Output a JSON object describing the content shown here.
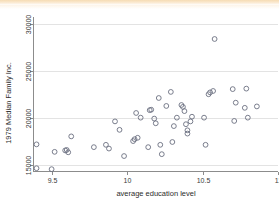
{
  "chart_data": {
    "type": "scatter",
    "title": "",
    "xlabel": "average education level",
    "ylabel": "1979 Median Family Inc.",
    "xlim": [
      9.38,
      11.0
    ],
    "ylim": [
      14300,
      30800
    ],
    "xticks": [
      9.5,
      10,
      10.5,
      11
    ],
    "xticklabels": [
      "9.5",
      "10",
      "10.5",
      "11"
    ],
    "yticks": [
      15000,
      20000,
      25000,
      30000
    ],
    "yticklabels": [
      "15000",
      "20000",
      "25000",
      "30000"
    ],
    "grid": "horizontal",
    "legend": "none",
    "marker": "open-circle",
    "marker_color": "#6b6f80",
    "background_color": "#ffffff",
    "points": [
      {
        "x": 9.4,
        "y": 17200
      },
      {
        "x": 9.4,
        "y": 14650
      },
      {
        "x": 9.5,
        "y": 14550
      },
      {
        "x": 9.52,
        "y": 16400
      },
      {
        "x": 9.59,
        "y": 16550
      },
      {
        "x": 9.6,
        "y": 16600
      },
      {
        "x": 9.61,
        "y": 16350
      },
      {
        "x": 9.63,
        "y": 18050
      },
      {
        "x": 9.78,
        "y": 16900
      },
      {
        "x": 9.86,
        "y": 17150
      },
      {
        "x": 9.88,
        "y": 16750
      },
      {
        "x": 9.92,
        "y": 19650
      },
      {
        "x": 9.95,
        "y": 18750
      },
      {
        "x": 9.98,
        "y": 15950
      },
      {
        "x": 10.04,
        "y": 17550
      },
      {
        "x": 10.05,
        "y": 17750
      },
      {
        "x": 10.06,
        "y": 20550
      },
      {
        "x": 10.07,
        "y": 17900
      },
      {
        "x": 10.09,
        "y": 20050
      },
      {
        "x": 10.14,
        "y": 16900
      },
      {
        "x": 10.15,
        "y": 20850
      },
      {
        "x": 10.16,
        "y": 20900
      },
      {
        "x": 10.18,
        "y": 19950
      },
      {
        "x": 10.19,
        "y": 19450
      },
      {
        "x": 10.21,
        "y": 22150
      },
      {
        "x": 10.22,
        "y": 17150
      },
      {
        "x": 10.23,
        "y": 16150
      },
      {
        "x": 10.26,
        "y": 21300
      },
      {
        "x": 10.29,
        "y": 22800
      },
      {
        "x": 10.3,
        "y": 17450
      },
      {
        "x": 10.31,
        "y": 19150
      },
      {
        "x": 10.33,
        "y": 20050
      },
      {
        "x": 10.36,
        "y": 21400
      },
      {
        "x": 10.37,
        "y": 21200
      },
      {
        "x": 10.38,
        "y": 20750
      },
      {
        "x": 10.39,
        "y": 19350
      },
      {
        "x": 10.4,
        "y": 18700
      },
      {
        "x": 10.4,
        "y": 18350
      },
      {
        "x": 10.42,
        "y": 19650
      },
      {
        "x": 10.43,
        "y": 20150
      },
      {
        "x": 10.51,
        "y": 20050
      },
      {
        "x": 10.52,
        "y": 17150
      },
      {
        "x": 10.54,
        "y": 22550
      },
      {
        "x": 10.55,
        "y": 22750
      },
      {
        "x": 10.57,
        "y": 22900
      },
      {
        "x": 10.58,
        "y": 28450
      },
      {
        "x": 10.7,
        "y": 23100
      },
      {
        "x": 10.71,
        "y": 19700
      },
      {
        "x": 10.72,
        "y": 21650
      },
      {
        "x": 10.78,
        "y": 21100
      },
      {
        "x": 10.79,
        "y": 23150
      },
      {
        "x": 10.8,
        "y": 20050
      },
      {
        "x": 10.86,
        "y": 21250
      }
    ]
  }
}
